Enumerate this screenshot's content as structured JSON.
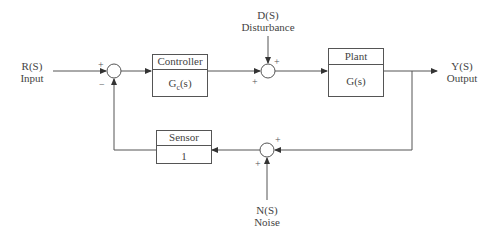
{
  "diagram": {
    "type": "closed-loop control block diagram",
    "colors": {
      "line": "#555555",
      "text": "#444444",
      "background": "#ffffff"
    },
    "signals": {
      "reference": {
        "symbol": "R(S)",
        "name": "Input"
      },
      "disturbance": {
        "symbol": "D(S)",
        "name": "Disturbance"
      },
      "output": {
        "symbol": "Y(S)",
        "name": "Output"
      },
      "noise": {
        "symbol": "N(S)",
        "name": "Noise"
      }
    },
    "blocks": {
      "controller": {
        "title": "Controller",
        "tf_main": "G",
        "tf_sub": "c",
        "tf_arg": "(s)"
      },
      "plant": {
        "title": "Plant",
        "tf": "G(s)"
      },
      "sensor": {
        "title": "Sensor",
        "tf": "1"
      }
    },
    "summing_junctions": {
      "error": {
        "in_ref": "+",
        "in_fb": "−"
      },
      "disturbance": {
        "in_top": "+",
        "in_left": "+"
      },
      "noise": {
        "in_right": "+",
        "in_bottom": "+"
      }
    }
  }
}
